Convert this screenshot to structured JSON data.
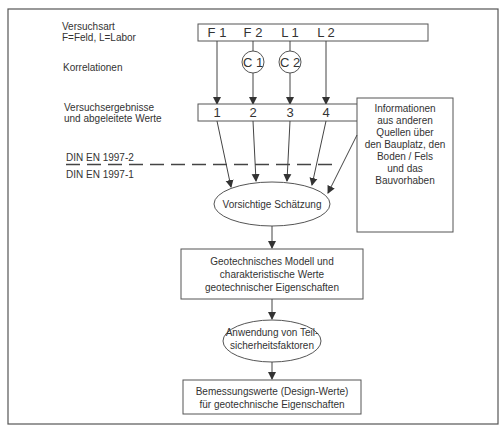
{
  "diagram": {
    "left_labels": {
      "versuchsart": [
        "Versuchsart",
        "F=Feld, L=Labor"
      ],
      "korrelationen": "Korrelationen",
      "ergebnisse": [
        "Versuchsergebnisse",
        "und abgeleitete Werte"
      ],
      "din_upper": "DIN EN 1997-2",
      "din_lower": "DIN EN 1997-1"
    },
    "test_types": [
      "F 1",
      "F 2",
      "L 1",
      "L 2"
    ],
    "correlations": [
      "C 1",
      "C 2"
    ],
    "results": [
      "1",
      "2",
      "3",
      "4"
    ],
    "info_box": [
      "Informationen",
      "aus anderen",
      "Quellen über",
      "den Bauplatz, den",
      "Boden / Fels",
      "und das",
      "Bauvorhaben"
    ],
    "estimate": "Vorsichtige Schätzung",
    "model_box": [
      "Geotechnisches Modell und",
      "charakteristische Werte",
      "geotechnischer Eigenschaften"
    ],
    "partial_factors": [
      "Anwendung von Teil-",
      "sicherheitsfaktoren"
    ],
    "design_box": [
      "Bemessungswerte (Design-Werte)",
      "für geotechnische Eigenschaften"
    ]
  }
}
